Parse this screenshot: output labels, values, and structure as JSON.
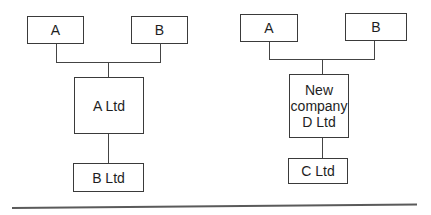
{
  "diagram_left": {
    "shareholders": [
      {
        "label": "A"
      },
      {
        "label": "B"
      }
    ],
    "parent": {
      "label": "A Ltd"
    },
    "subsidiary": {
      "label": "B Ltd"
    }
  },
  "diagram_right": {
    "shareholders": [
      {
        "label": "A"
      },
      {
        "label": "B"
      }
    ],
    "parent": {
      "label": "New\ncompany\nD Ltd"
    },
    "subsidiary": {
      "label": "C Ltd"
    }
  },
  "colors": {
    "line": "#444444",
    "box_border": "#3a3a3a",
    "text": "#1e1e1e",
    "background": "#ffffff"
  }
}
